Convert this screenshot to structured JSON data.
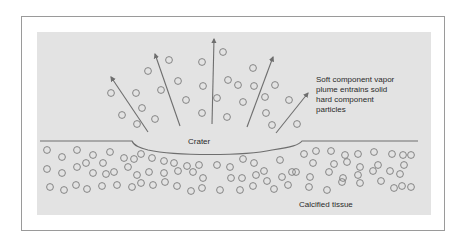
{
  "diagram": {
    "labels": {
      "crater": "Crater",
      "plume": [
        "Soft component vapor",
        "plume entrains solid",
        "hard component",
        "particles"
      ],
      "tissue": "Calcified tissue"
    },
    "colors": {
      "background": "#ffffff",
      "panel": "#e3e3e3",
      "frame": "#9a9a9a",
      "line": "#6e6e6e",
      "particle_stroke": "#7a7a7a",
      "text": "#2a2a2a"
    },
    "arrows": [
      {
        "x1": 148,
        "y1": 132,
        "x2": 111,
        "y2": 77
      },
      {
        "x1": 180,
        "y1": 126,
        "x2": 155,
        "y2": 54
      },
      {
        "x1": 212,
        "y1": 124,
        "x2": 214,
        "y2": 39
      },
      {
        "x1": 247,
        "y1": 127,
        "x2": 273,
        "y2": 57
      },
      {
        "x1": 276,
        "y1": 133,
        "x2": 308,
        "y2": 93
      }
    ],
    "plume_particles": [
      [
        111,
        93
      ],
      [
        136,
        93
      ],
      [
        122,
        115
      ],
      [
        142,
        108
      ],
      [
        137,
        124
      ],
      [
        155,
        119
      ],
      [
        148,
        71
      ],
      [
        169,
        60
      ],
      [
        178,
        81
      ],
      [
        161,
        90
      ],
      [
        186,
        100
      ],
      [
        202,
        62
      ],
      [
        223,
        52
      ],
      [
        203,
        86
      ],
      [
        202,
        113
      ],
      [
        228,
        80
      ],
      [
        238,
        85
      ],
      [
        217,
        98
      ],
      [
        243,
        102
      ],
      [
        227,
        117
      ],
      [
        253,
        68
      ],
      [
        254,
        86
      ],
      [
        275,
        85
      ],
      [
        265,
        97
      ],
      [
        266,
        113
      ],
      [
        272,
        125
      ],
      [
        289,
        100
      ],
      [
        297,
        124
      ]
    ],
    "tissue_particles": [
      [
        47,
        150
      ],
      [
        62,
        157
      ],
      [
        77,
        150
      ],
      [
        93,
        155
      ],
      [
        110,
        152
      ],
      [
        124,
        158
      ],
      [
        47,
        169
      ],
      [
        62,
        173
      ],
      [
        77,
        167
      ],
      [
        86,
        163
      ],
      [
        103,
        163
      ],
      [
        93,
        173
      ],
      [
        106,
        174
      ],
      [
        114,
        172
      ],
      [
        128,
        167
      ],
      [
        50,
        187
      ],
      [
        64,
        190
      ],
      [
        76,
        185
      ],
      [
        87,
        189
      ],
      [
        102,
        186
      ],
      [
        117,
        185
      ],
      [
        134,
        159
      ],
      [
        141,
        154
      ],
      [
        152,
        158
      ],
      [
        164,
        161
      ],
      [
        174,
        163
      ],
      [
        187,
        166
      ],
      [
        199,
        165
      ],
      [
        137,
        175
      ],
      [
        149,
        172
      ],
      [
        164,
        173
      ],
      [
        178,
        171
      ],
      [
        193,
        172
      ],
      [
        203,
        178
      ],
      [
        132,
        187
      ],
      [
        141,
        183
      ],
      [
        153,
        185
      ],
      [
        165,
        182
      ],
      [
        177,
        186
      ],
      [
        191,
        191
      ],
      [
        202,
        188
      ],
      [
        217,
        165
      ],
      [
        230,
        167
      ],
      [
        243,
        159
      ],
      [
        254,
        163
      ],
      [
        264,
        171
      ],
      [
        280,
        160
      ],
      [
        231,
        178
      ],
      [
        242,
        178
      ],
      [
        256,
        175
      ],
      [
        267,
        181
      ],
      [
        282,
        177
      ],
      [
        292,
        172
      ],
      [
        220,
        190
      ],
      [
        240,
        190
      ],
      [
        253,
        186
      ],
      [
        274,
        189
      ],
      [
        288,
        185
      ],
      [
        304,
        154
      ],
      [
        316,
        151
      ],
      [
        331,
        151
      ],
      [
        345,
        155
      ],
      [
        358,
        154
      ],
      [
        374,
        152
      ],
      [
        313,
        163
      ],
      [
        334,
        164
      ],
      [
        347,
        162
      ],
      [
        360,
        167
      ],
      [
        378,
        165
      ],
      [
        392,
        154
      ],
      [
        403,
        155
      ],
      [
        296,
        172
      ],
      [
        310,
        177
      ],
      [
        329,
        172
      ],
      [
        343,
        178
      ],
      [
        358,
        175
      ],
      [
        373,
        171
      ],
      [
        390,
        171
      ],
      [
        400,
        174
      ],
      [
        309,
        187
      ],
      [
        327,
        190
      ],
      [
        342,
        182
      ],
      [
        360,
        183
      ],
      [
        381,
        181
      ],
      [
        394,
        188
      ],
      [
        402,
        186
      ],
      [
        411,
        187
      ],
      [
        404,
        165
      ],
      [
        411,
        155
      ]
    ],
    "surface_path": "M40,141 L132,141 C134,146 140,148 148,150 C175,156 245,156 272,150 C292,147 299,145 302,141 L418,141"
  }
}
